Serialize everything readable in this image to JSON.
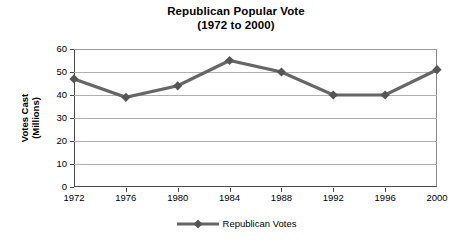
{
  "chart_data": {
    "type": "line",
    "title": "Republican Popular Vote",
    "subtitle": "(1972 to 2000)",
    "xlabel": "",
    "ylabel_line1": "Votes Cast",
    "ylabel_line2": "(Millions)",
    "categories": [
      "1972",
      "1976",
      "1980",
      "1984",
      "1988",
      "1992",
      "1996",
      "2000"
    ],
    "series": [
      {
        "name": "Republican Votes",
        "values": [
          47,
          39,
          44,
          55,
          50,
          40,
          40,
          51
        ],
        "color": "#666666",
        "marker": "diamond"
      }
    ],
    "ylim": [
      0,
      60
    ],
    "yticks": [
      0,
      10,
      20,
      30,
      40,
      50,
      60
    ],
    "ytick_labels": [
      "0",
      "10",
      "20",
      "30",
      "40",
      "50",
      "60"
    ],
    "grid": true,
    "grid_color": "#b0b0b0",
    "legend_position": "bottom",
    "legend_entries": [
      "Republican Votes"
    ]
  }
}
